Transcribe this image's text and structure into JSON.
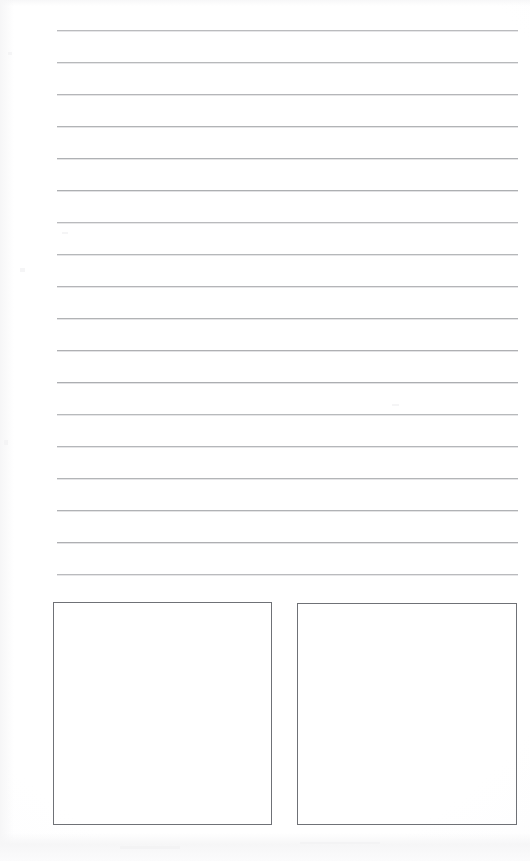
{
  "page": {
    "document_type": "blank-lined-worksheet",
    "width": 530,
    "height": 861,
    "background_color": "#fdfdfd",
    "visible_text": "",
    "notes_label": "",
    "title": ""
  },
  "ruled_lines": {
    "count": 18,
    "color": "#a9abae",
    "thickness_px": 1,
    "spacing_px": 32,
    "left_x": 57,
    "right_x": 518,
    "first_y": 30,
    "y_positions": [
      30,
      62,
      94,
      126,
      158,
      190,
      222,
      254,
      286,
      318,
      350,
      382,
      414,
      446,
      478,
      510,
      542,
      574
    ]
  },
  "answer_boxes": {
    "count": 2,
    "border_color": "#6f7176",
    "border_width_px": 1.4,
    "fill": "none",
    "items": [
      {
        "name": "left-answer-box",
        "label": "",
        "content": "",
        "x": 53,
        "y": 602,
        "width": 219,
        "height": 223
      },
      {
        "name": "right-answer-box",
        "label": "",
        "content": "",
        "x": 297,
        "y": 603,
        "width": 220,
        "height": 222
      }
    ]
  },
  "margins": {
    "left_margin_px": 57,
    "right_margin_px": 12,
    "top_margin_px": 30,
    "bottom_margin_px": 36
  }
}
